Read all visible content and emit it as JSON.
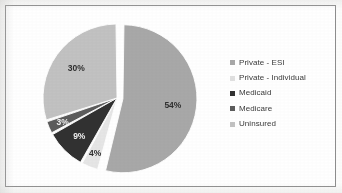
{
  "chart_data": {
    "type": "pie",
    "title": "",
    "subtitle": "",
    "xlabel": "",
    "ylabel": "",
    "grid": false,
    "legend_position": "right",
    "units": "percent",
    "total": 100,
    "categories": [
      "Private - ESI",
      "Private - Individual",
      "Medicaid",
      "Medicare",
      "Uninsured"
    ],
    "values": [
      54,
      4,
      9,
      3,
      30
    ],
    "data_labels": [
      "54%",
      "4%",
      "9%",
      "3%",
      "30%"
    ],
    "slices": [
      {
        "label": "Private - ESI",
        "value": 54,
        "data_label": "54%",
        "color": "#a8a8a8",
        "exploded": true,
        "label_on_dark": false
      },
      {
        "label": "Private - Individual",
        "value": 4,
        "data_label": "4%",
        "color": "#e6e6e6",
        "exploded": false,
        "label_on_dark": false
      },
      {
        "label": "Medicaid",
        "value": 9,
        "data_label": "9%",
        "color": "#313131",
        "exploded": false,
        "label_on_dark": true
      },
      {
        "label": "Medicare",
        "value": 3,
        "data_label": "3%",
        "color": "#5c5c5c",
        "exploded": false,
        "label_on_dark": true
      },
      {
        "label": "Uninsured",
        "value": 30,
        "data_label": "30%",
        "color": "#c2c2c2",
        "exploded": false,
        "label_on_dark": false
      }
    ]
  },
  "legend": {
    "items": [
      {
        "label": "Private - ESI",
        "color": "#a8a8a8"
      },
      {
        "label": "Private - Individual",
        "color": "#e0e0e0"
      },
      {
        "label": "Medicaid",
        "color": "#313131"
      },
      {
        "label": "Medicare",
        "color": "#5c5c5c"
      },
      {
        "label": "Uninsured",
        "color": "#c2c2c2"
      }
    ]
  },
  "frame": {
    "border_color": "#8e8e8e",
    "background_color": "#ffffff"
  }
}
